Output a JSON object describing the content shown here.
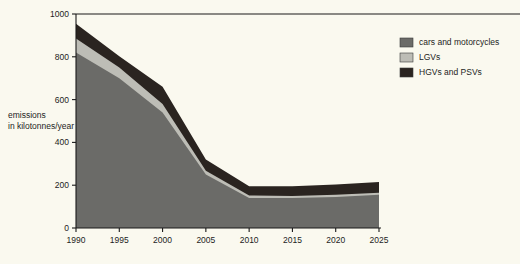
{
  "chart_data": {
    "type": "area",
    "stacked": true,
    "title": "",
    "xlabel": "",
    "ylabel": "emissions\nin kilotonnes/year",
    "ylabel_line1": "emissions",
    "ylabel_line2": "in kilotonnes/year",
    "x": [
      1990,
      1995,
      2000,
      2005,
      2010,
      2015,
      2020,
      2025
    ],
    "xtick_labels": [
      "1990",
      "1995",
      "2000",
      "2005",
      "2010",
      "2015",
      "2020",
      "2025"
    ],
    "ytick_labels": [
      "0",
      "200",
      "400",
      "600",
      "800",
      "1000"
    ],
    "yticks": [
      0,
      200,
      400,
      600,
      800,
      1000
    ],
    "xlim": [
      1990,
      2025
    ],
    "ylim": [
      0,
      1000
    ],
    "grid": false,
    "legend_position": "right",
    "series": [
      {
        "name": "cars and motorcycles",
        "color": "#6b6b68",
        "values": [
          820,
          700,
          540,
          250,
          140,
          140,
          145,
          155
        ]
      },
      {
        "name": "LGVs",
        "color": "#bdbdb6",
        "values": [
          65,
          50,
          40,
          18,
          12,
          10,
          10,
          10
        ]
      },
      {
        "name": "HGVs and PSVs",
        "color": "#2a2420",
        "values": [
          70,
          52,
          80,
          52,
          43,
          45,
          48,
          50
        ]
      }
    ],
    "cumulative_tops": [
      {
        "year": 1990,
        "cars": 820,
        "plus_lgv": 885,
        "total": 955
      },
      {
        "year": 1995,
        "cars": 700,
        "plus_lgv": 750,
        "total": 802
      },
      {
        "year": 2000,
        "cars": 540,
        "plus_lgv": 580,
        "total": 660
      },
      {
        "year": 2005,
        "cars": 250,
        "plus_lgv": 268,
        "total": 320
      },
      {
        "year": 2010,
        "cars": 140,
        "plus_lgv": 152,
        "total": 195
      },
      {
        "year": 2015,
        "cars": 140,
        "plus_lgv": 150,
        "total": 195
      },
      {
        "year": 2020,
        "cars": 145,
        "plus_lgv": 155,
        "total": 203
      },
      {
        "year": 2025,
        "cars": 155,
        "plus_lgv": 165,
        "total": 215
      }
    ]
  },
  "legend": {
    "items": [
      {
        "label": "cars and motorcycles",
        "color": "#6b6b68"
      },
      {
        "label": "LGVs",
        "color": "#bdbdb6"
      },
      {
        "label": "HGVs and PSVs",
        "color": "#2a2420"
      }
    ]
  },
  "colors": {
    "background": "#faf9ef",
    "axis": "#1a1a1a",
    "text": "#1d1d1d",
    "cars": "#6b6b68",
    "lgvs": "#bdbdb6",
    "hgvs": "#2a2420"
  }
}
